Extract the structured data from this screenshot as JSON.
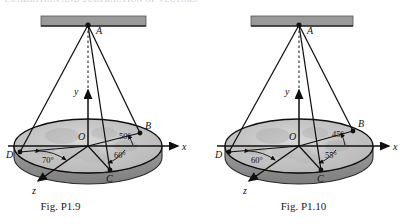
{
  "page": {
    "top_partial_text": "1.6  ADDITION  AND  SUBTRACTION  OF  VECTORS",
    "background_color": "#ffffff",
    "line_color": "#101010",
    "ceiling_color": "#9a9a9a",
    "disk_face_color": "#c8c8c8",
    "disk_rim_color": "#8d8d8d"
  },
  "figures": [
    {
      "id": "fig-p19",
      "caption": "Fig. P1.9",
      "points": {
        "apex": "A",
        "origin": "O",
        "right": "B",
        "front": "C",
        "left": "D"
      },
      "axes": {
        "x": "x",
        "y": "y",
        "z": "z"
      },
      "angles": [
        {
          "name": "angle-OB-x",
          "value": "50°"
        },
        {
          "name": "angle-OC-x",
          "value": "60°"
        },
        {
          "name": "angle-OD-OC",
          "value": "70°"
        }
      ]
    },
    {
      "id": "fig-p110",
      "caption": "Fig. P1.10",
      "points": {
        "apex": "A",
        "origin": "O",
        "right": "B",
        "front": "C",
        "left": "D"
      },
      "axes": {
        "x": "x",
        "y": "y",
        "z": "z"
      },
      "angles": [
        {
          "name": "angle-OB-x",
          "value": "45°"
        },
        {
          "name": "angle-OC-x",
          "value": "55°"
        },
        {
          "name": "angle-OD-OC",
          "value": "60°"
        }
      ]
    }
  ]
}
